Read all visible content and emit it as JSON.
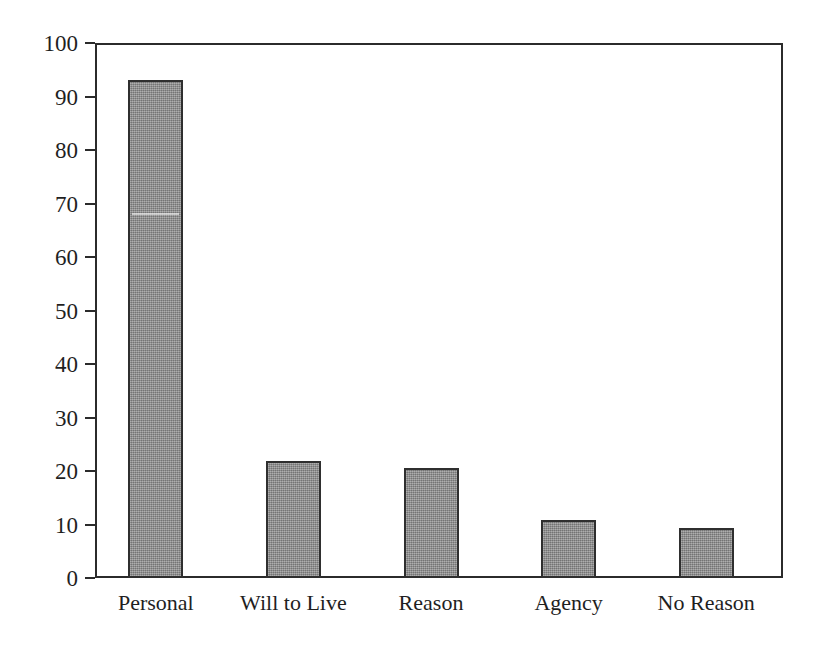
{
  "chart_data": {
    "type": "bar",
    "title": "",
    "subtitle": "",
    "xlabel": "",
    "ylabel": "",
    "categories": [
      "Personal",
      "Will to Live",
      "Reason",
      "Agency",
      "No Reason"
    ],
    "values": [
      93,
      21.8,
      20.6,
      10.8,
      9.4
    ],
    "series": [
      {
        "name": "",
        "values": [
          93,
          21.8,
          20.6,
          10.8,
          9.4
        ]
      }
    ],
    "ylim": [
      0,
      100
    ],
    "yticks": [
      0,
      10,
      20,
      30,
      40,
      50,
      60,
      70,
      80,
      90,
      100
    ],
    "ytick_labels": [
      "0",
      "10",
      "20",
      "30",
      "40",
      "50",
      "60",
      "70",
      "80",
      "90",
      "100"
    ],
    "grid": false,
    "legend": null,
    "legend_position": "none",
    "annotations": [],
    "bar_fill_color": "#8e8e8e",
    "bar_edge_color": "#2f2f2f",
    "axis_color": "#2b2b2b",
    "background_color": "#ffffff",
    "text_color": "#1f1f1f"
  }
}
